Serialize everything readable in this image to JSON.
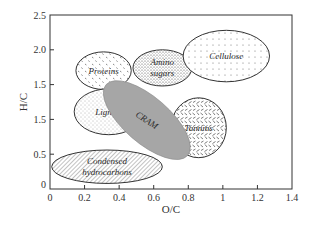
{
  "chart_data": {
    "type": "scatter",
    "subtype": "region-ellipses (van Krevelen diagram)",
    "title": "",
    "xlabel": "O/C",
    "ylabel": "H/C",
    "xlim": [
      0,
      1.4
    ],
    "ylim": [
      0,
      2.5
    ],
    "x_ticks": [
      "0",
      "0.2",
      "0.4",
      "0.6",
      "0.8",
      "1",
      "1.2",
      "1.4"
    ],
    "x_tick_values": [
      0,
      0.2,
      0.4,
      0.6,
      0.8,
      1.0,
      1.2,
      1.4
    ],
    "y_ticks": [
      "0",
      "0.5",
      "1.5",
      "1.5",
      "2.0",
      "2.5"
    ],
    "y_tick_values": [
      0,
      0.5,
      1.0,
      1.5,
      2.0,
      2.5
    ],
    "grid": false,
    "legend": null,
    "regions": [
      {
        "name": "Proteins",
        "label_lines": [
          "Proteins"
        ],
        "cx": 0.31,
        "cy": 1.7,
        "rx": 0.16,
        "ry": 0.27,
        "angle": 0,
        "fill": "dots-coarse",
        "color": "#ffffff"
      },
      {
        "name": "Amino sugars",
        "label_lines": [
          "Amino",
          "sugars"
        ],
        "cx": 0.65,
        "cy": 1.74,
        "rx": 0.17,
        "ry": 0.26,
        "angle": 0,
        "fill": "dots-dense",
        "color": "#ffffff"
      },
      {
        "name": "Cellulose",
        "label_lines": [
          "Cellulose"
        ],
        "cx": 1.02,
        "cy": 1.91,
        "rx": 0.25,
        "ry": 0.37,
        "angle": 0,
        "fill": "dots-grid",
        "color": "#ffffff"
      },
      {
        "name": "Lignins",
        "label_lines": [
          "Lignins"
        ],
        "cx": 0.34,
        "cy": 1.11,
        "rx": 0.2,
        "ry": 0.33,
        "angle": 0,
        "fill": "dots-fine",
        "color": "#ffffff"
      },
      {
        "name": "Tannins",
        "label_lines": [
          "Tannins"
        ],
        "cx": 0.86,
        "cy": 0.88,
        "rx": 0.16,
        "ry": 0.43,
        "angle": 0,
        "fill": "dashes",
        "color": "#ffffff"
      },
      {
        "name": "CRAM",
        "label_lines": [
          "CRAM"
        ],
        "cx": 0.56,
        "cy": 0.99,
        "major_px": 54,
        "minor_px": 23,
        "angle": 41,
        "fill": "solid",
        "color": "#a6a6a6"
      },
      {
        "name": "Condensed hydrocarbons",
        "label_lines": [
          "Condensed",
          "hydrocarbons"
        ],
        "cx": 0.33,
        "cy": 0.32,
        "rx": 0.32,
        "ry": 0.24,
        "angle": 0,
        "fill": "hatch",
        "color": "#ffffff"
      }
    ]
  }
}
